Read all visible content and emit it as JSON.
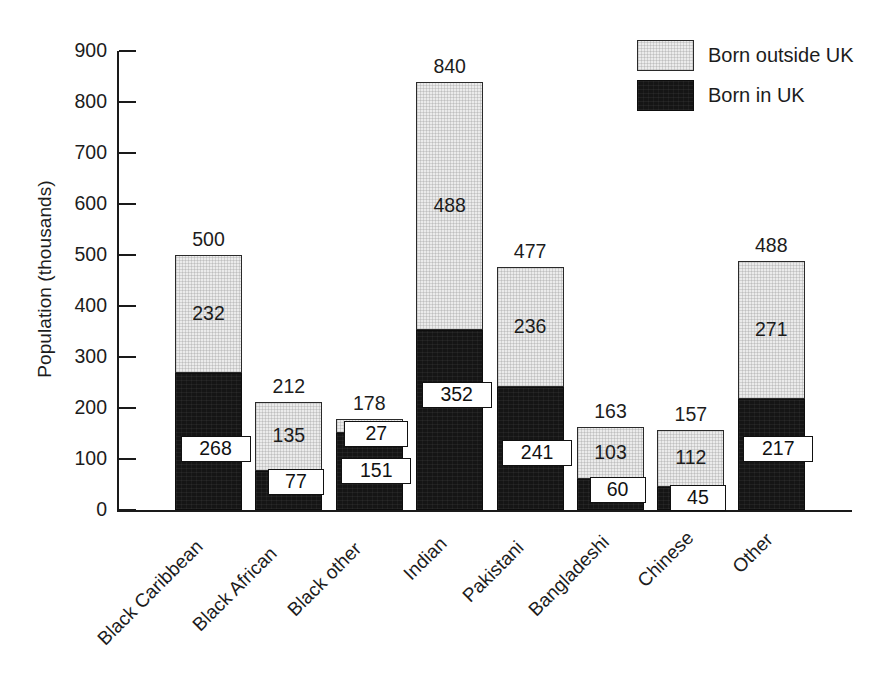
{
  "chart_data": {
    "type": "bar",
    "subtype": "stacked-vertical",
    "title": "",
    "xlabel": "",
    "ylabel": "Population (thousands)",
    "ylim": [
      0,
      900
    ],
    "ytick_step": 100,
    "yticks": [
      0,
      100,
      200,
      300,
      400,
      500,
      600,
      700,
      800,
      900
    ],
    "ytick_labels": [
      "0",
      "100",
      "200",
      "300",
      "400",
      "500",
      "600",
      "700",
      "800",
      "900"
    ],
    "grid": false,
    "legend_position": "top-right",
    "categories": [
      "Black Caribbean",
      "Black African",
      "Black other",
      "Indian",
      "Pakistani",
      "Bangladeshi",
      "Chinese",
      "Other"
    ],
    "series": [
      {
        "name": "Born in UK",
        "color": "#151515",
        "values": [
          268,
          77,
          151,
          352,
          241,
          60,
          45,
          217
        ]
      },
      {
        "name": "Born outside UK",
        "color": "#ebebeb",
        "values": [
          232,
          135,
          27,
          488,
          236,
          103,
          112,
          271
        ]
      }
    ],
    "totals": [
      500,
      212,
      178,
      840,
      477,
      163,
      157,
      488
    ],
    "total_labels": [
      "500",
      "212",
      "178",
      "840",
      "477",
      "163",
      "157",
      "488"
    ],
    "segment_labels": {
      "born_in_uk": [
        "268",
        "77",
        "151",
        "352",
        "241",
        "60",
        "45",
        "217"
      ],
      "born_outside_uk": [
        "232",
        "135",
        "27",
        "488",
        "236",
        "103",
        "112",
        "271"
      ]
    }
  },
  "axis": {
    "y_title": "Population (thousands)"
  },
  "legend": {
    "items": [
      {
        "label": "Born outside UK",
        "swatch": "light"
      },
      {
        "label": "Born in UK",
        "swatch": "dark"
      }
    ]
  }
}
